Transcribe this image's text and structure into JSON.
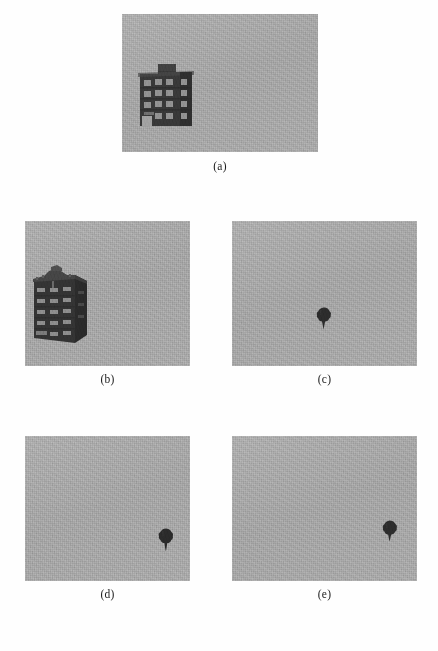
{
  "figure": {
    "type": "multi-panel-grayscale-image-figure",
    "panel_count": 5,
    "background_color": "#ffffff",
    "panel_background_color": "#a9a9a9",
    "object_color": "#2e2e2e",
    "caption_color": "#1a1a1a"
  },
  "panels": [
    {
      "id": "a",
      "caption": "(a)",
      "content": "building",
      "description": "Grayscale aerial-style image of a dark multi-story building with windows, positioned left-of-center on a uniform gray background",
      "object_position": "left-center",
      "x": 122,
      "y": 14,
      "width": 196,
      "height": 138
    },
    {
      "id": "b",
      "caption": "(b)",
      "content": "building",
      "description": "Grayscale oblique view of a dark multi-story building with cornice and window rows, positioned at the left on a uniform gray background",
      "object_position": "left",
      "x": 25,
      "y": 221,
      "width": 165,
      "height": 145
    },
    {
      "id": "c",
      "caption": "(c)",
      "content": "tree",
      "description": "Small dark tree-shaped blob near the center-right of a uniform gray background",
      "object_position": "center",
      "x": 232,
      "y": 221,
      "width": 185,
      "height": 145
    },
    {
      "id": "d",
      "caption": "(d)",
      "content": "tree",
      "description": "Small dark tree-shaped blob on the right side of a uniform gray background",
      "object_position": "center-right",
      "x": 25,
      "y": 436,
      "width": 165,
      "height": 145
    },
    {
      "id": "e",
      "caption": "(e)",
      "content": "tree",
      "description": "Small dark tree-shaped blob at the far right edge of a uniform gray background",
      "object_position": "right",
      "x": 232,
      "y": 436,
      "width": 185,
      "height": 145
    }
  ],
  "objects": {
    "tree_c": {
      "cx": 91,
      "cy": 97,
      "w": 15,
      "h": 21
    },
    "tree_d": {
      "cx": 140,
      "cy": 103,
      "w": 15,
      "h": 22
    },
    "tree_e": {
      "cx": 157,
      "cy": 94,
      "w": 15,
      "h": 20
    }
  }
}
